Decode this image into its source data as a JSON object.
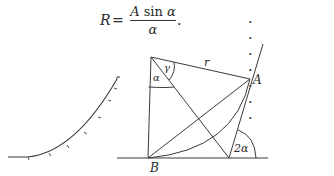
{
  "equation": {
    "lhs": "R",
    "equals": "=",
    "numerator_var": "A",
    "numerator_fn": " sin ",
    "numerator_arg": "α",
    "denominator": "α",
    "trailing_period": ".",
    "leader_dots": ". . . . . . .",
    "number": "(7.21)"
  },
  "figure": {
    "labels": {
      "point_A": "A",
      "point_B": "B",
      "radius": "r",
      "angle_gamma": "γ",
      "angle_alpha": "α",
      "angle_two_alpha": "2α"
    },
    "stroke_color": "#3a3a3a"
  }
}
